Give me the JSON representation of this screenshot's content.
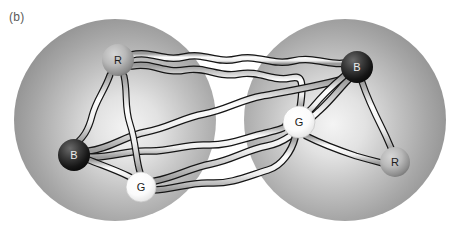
{
  "figure": {
    "panel_label": "(b)",
    "type": "diagram",
    "canvas": {
      "width": 459,
      "height": 228
    },
    "background_color": "#ffffff"
  },
  "colors": {
    "sphere_edge": "#8a8a8a",
    "sphere_mid": "#b4b4b4",
    "sphere_highlight": "#f2f2f2",
    "node_red_edge": "#6e6e6e",
    "node_red_center": "#c8c8c8",
    "node_black_edge": "#080808",
    "node_black_center": "#585858",
    "node_green_edge": "#d8d8d8",
    "node_green_center": "#ffffff",
    "tube_outline": "#171717",
    "tube_fill": "#fbfbfb",
    "label_text": "#5a5a5a",
    "node_label_dark": "#1c1c1c",
    "node_label_light": "#f0f0f0"
  },
  "spheres": [
    {
      "id": "sphere-left",
      "name": "left-sphere",
      "cx": 115,
      "cy": 120,
      "r": 101,
      "highlight_cx": 128,
      "highlight_cy": 128
    },
    {
      "id": "sphere-right",
      "name": "right-sphere",
      "cx": 345,
      "cy": 120,
      "r": 101,
      "highlight_cx": 332,
      "highlight_cy": 126
    }
  ],
  "nodes": [
    {
      "id": "left-R",
      "label": "R",
      "sphere": "left",
      "kind": "red",
      "cx": 118,
      "cy": 60,
      "r": 16,
      "label_color": "dark"
    },
    {
      "id": "left-B",
      "label": "B",
      "sphere": "left",
      "kind": "black",
      "cx": 74,
      "cy": 155,
      "r": 16,
      "label_color": "light"
    },
    {
      "id": "left-G",
      "label": "G",
      "sphere": "left",
      "kind": "green",
      "cx": 141,
      "cy": 187,
      "r": 15,
      "label_color": "dark"
    },
    {
      "id": "right-B",
      "label": "B",
      "sphere": "right",
      "kind": "black",
      "cx": 357,
      "cy": 67,
      "r": 16,
      "label_color": "light"
    },
    {
      "id": "right-G",
      "label": "G",
      "sphere": "right",
      "kind": "green",
      "cx": 299,
      "cy": 122,
      "r": 16,
      "label_color": "dark"
    },
    {
      "id": "right-R",
      "label": "R",
      "sphere": "right",
      "kind": "red",
      "cx": 395,
      "cy": 162,
      "r": 15,
      "label_color": "dark"
    }
  ],
  "intra_links": [
    {
      "id": "link-left-R-B",
      "from": "left-R",
      "to": "left-B",
      "scope": "left"
    },
    {
      "id": "link-left-R-G",
      "from": "left-R",
      "to": "left-G",
      "scope": "left"
    },
    {
      "id": "link-left-B-G",
      "from": "left-B",
      "to": "left-G",
      "scope": "left"
    },
    {
      "id": "link-right-B-G",
      "from": "right-B",
      "to": "right-G",
      "scope": "right"
    },
    {
      "id": "link-right-B-R",
      "from": "right-B",
      "to": "right-R",
      "scope": "right"
    },
    {
      "id": "link-right-G-R",
      "from": "right-G",
      "to": "right-R",
      "scope": "right"
    }
  ],
  "inter_links": [
    {
      "id": "bridge-leftR-rightB",
      "from": "left-R",
      "to": "right-B"
    },
    {
      "id": "bridge-leftR-rightG",
      "from": "left-R",
      "to": "right-G"
    },
    {
      "id": "bridge-leftB-rightB",
      "from": "left-B",
      "to": "right-B"
    },
    {
      "id": "bridge-leftB-rightG",
      "from": "left-B",
      "to": "right-G"
    },
    {
      "id": "bridge-leftG-rightB",
      "from": "left-G",
      "to": "right-B"
    },
    {
      "id": "bridge-leftG-rightG",
      "from": "left-G",
      "to": "right-G"
    }
  ]
}
